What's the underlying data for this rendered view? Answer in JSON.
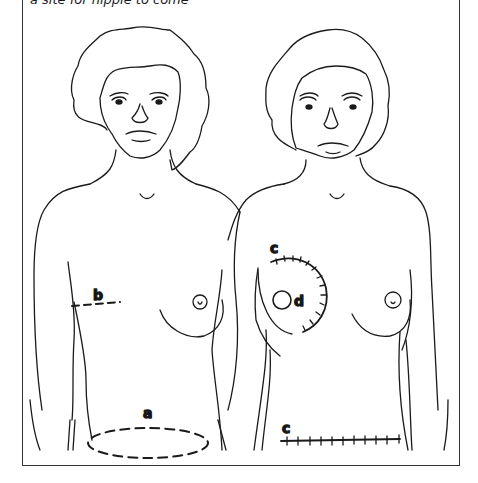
{
  "figure": {
    "caption_fragment": "a site for nipple to come",
    "stroke_color": "#1a1a1a",
    "panels": [
      {
        "id": "left-figure",
        "description": "Female torso showing donor sites",
        "labels": [
          {
            "key": "a",
            "text": "a",
            "marks": "dashed ellipse on lower abdomen"
          },
          {
            "key": "b",
            "text": "b",
            "marks": "dashed line under right breast fold"
          }
        ]
      },
      {
        "id": "right-figure",
        "description": "Female torso after reconstruction",
        "labels": [
          {
            "key": "c1",
            "text": "c",
            "marks": "stitched arc around reconstructed breast"
          },
          {
            "key": "d",
            "text": "d",
            "marks": "circle marking new nipple site"
          },
          {
            "key": "c2",
            "text": "c",
            "marks": "stitched horizontal scar on lower abdomen"
          }
        ]
      }
    ]
  }
}
